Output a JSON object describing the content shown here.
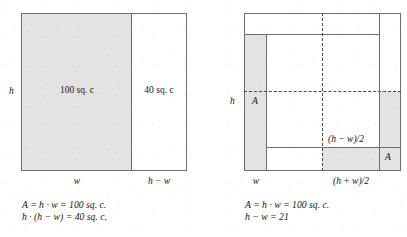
{
  "figure": {
    "left_diagram": {
      "name": "rectangle-area-split-diagram",
      "shaded_region_label": "100 sq. c",
      "white_region_label": "40 sq. c",
      "height_label": "h",
      "bottom_left_label": "w",
      "bottom_right_label": "h − w",
      "formula_line1": "A = h · w = 100 sq. c.",
      "formula_line2": "h · (h − w) = 40 sq. c."
    },
    "right_diagram": {
      "name": "completing-the-square-diagram",
      "height_label": "h",
      "inner_area_label": "A",
      "corner_area_label": "A",
      "half_difference_label": "(h − w)/2",
      "bottom_left_label": "w",
      "bottom_right_label": "(h + w)/2",
      "formula_line1": "A = h · w = 100 sq. c.",
      "formula_line2": "h − w = 21"
    },
    "colors": {
      "shade": "#e3e3e3",
      "stroke": "#6e6e6e",
      "dashed_stroke": "#4a4a4a",
      "text": "#141414",
      "background": "#ffffff"
    }
  }
}
